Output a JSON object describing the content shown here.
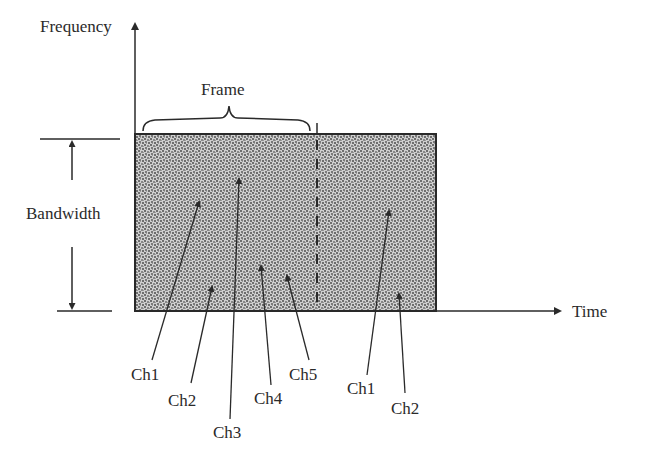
{
  "diagram": {
    "axes": {
      "y_label": "Frequency",
      "x_label": "Time"
    },
    "frame_label": "Frame",
    "bandwidth_label": "Bandwidth",
    "channels": [
      {
        "label": "Ch1",
        "group": "frame-1"
      },
      {
        "label": "Ch2",
        "group": "frame-1"
      },
      {
        "label": "Ch3",
        "group": "frame-1"
      },
      {
        "label": "Ch4",
        "group": "frame-1"
      },
      {
        "label": "Ch5",
        "group": "frame-1"
      },
      {
        "label": "Ch1",
        "group": "frame-2"
      },
      {
        "label": "Ch2",
        "group": "frame-2"
      }
    ],
    "colors": {
      "ink": "#2a2a2a",
      "fill_dark": "#7a7a7a",
      "fill_light": "#d8d8d8"
    }
  }
}
